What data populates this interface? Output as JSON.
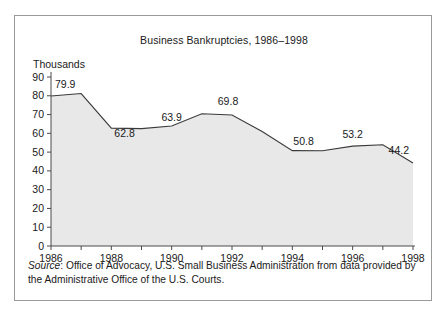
{
  "figure": {
    "title": "Business Bankruptcies, 1986–1998",
    "y_axis_unit": "Thousands",
    "source_label": "Source",
    "source_separator": ": ",
    "source_text": "Office of Advocacy, U.S. Small Business Administration from data provided by the Administrative Office of the U.S. Courts.",
    "border_color": "#9a9a9a",
    "area_fill_color": "#e8e8e8",
    "line_color": "#3a3a3a",
    "text_color": "#1a1a1a"
  },
  "chart_data": {
    "type": "area",
    "title": "Business Bankruptcies, 1986–1998",
    "xlabel": "",
    "ylabel": "Thousands",
    "xlim": [
      1986,
      1998
    ],
    "ylim": [
      0,
      90
    ],
    "grid": false,
    "legend": "none",
    "x": [
      1986,
      1987,
      1988,
      1989,
      1990,
      1991,
      1992,
      1993,
      1994,
      1995,
      1996,
      1997,
      1998
    ],
    "values": [
      79.9,
      81.2,
      62.8,
      62.5,
      63.9,
      70.4,
      69.8,
      61.0,
      50.8,
      50.7,
      53.2,
      53.9,
      44.2
    ],
    "x_tick_labels": [
      "1986",
      "1988",
      "1990",
      "1992",
      "1994",
      "1996",
      "1998"
    ],
    "x_tick_values": [
      1986,
      1988,
      1990,
      1992,
      1994,
      1996,
      1998
    ],
    "y_tick_labels": [
      "0",
      "10",
      "20",
      "30",
      "40",
      "50",
      "60",
      "70",
      "80",
      "90"
    ],
    "y_tick_values": [
      0,
      10,
      20,
      30,
      40,
      50,
      60,
      70,
      80,
      90
    ],
    "point_labels": [
      {
        "x": 1986,
        "value": 79.9,
        "label": "79.9"
      },
      {
        "x": 1988,
        "value": 62.8,
        "label": "62.8"
      },
      {
        "x": 1990,
        "value": 63.9,
        "label": "63.9"
      },
      {
        "x": 1992,
        "value": 69.8,
        "label": "69.8"
      },
      {
        "x": 1994,
        "value": 50.8,
        "label": "50.8"
      },
      {
        "x": 1996,
        "value": 53.2,
        "label": "53.2"
      },
      {
        "x": 1998,
        "value": 44.2,
        "label": "44.2"
      }
    ]
  }
}
